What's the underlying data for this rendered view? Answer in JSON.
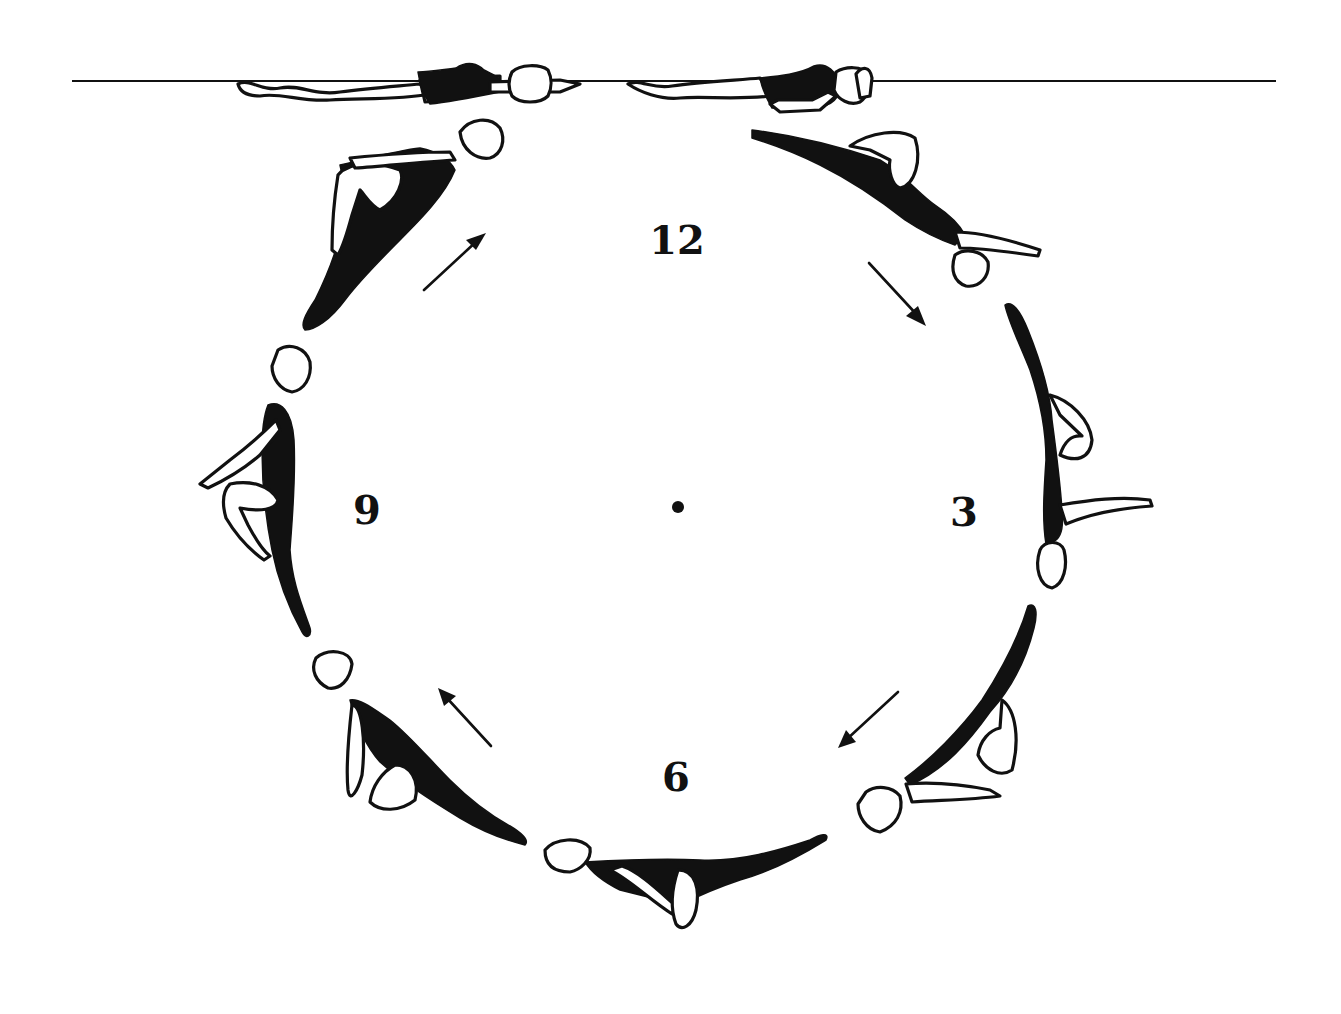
{
  "diagram": {
    "type": "synchronized-swimming-figure-rotation",
    "water_line": {
      "y": 81,
      "x_start": 72,
      "x_end": 1276
    },
    "center_marker": {
      "x": 678,
      "y": 507
    },
    "clock_labels": [
      {
        "id": "12",
        "text": "12",
        "x": 677,
        "y": 240
      },
      {
        "id": "3",
        "text": "3",
        "x": 964,
        "y": 512
      },
      {
        "id": "6",
        "text": "6",
        "x": 676,
        "y": 777
      },
      {
        "id": "9",
        "text": "9",
        "x": 367,
        "y": 510
      }
    ],
    "arrows": [
      {
        "id": "arrow-upper-left",
        "direction": "up-right",
        "from": [
          424,
          290
        ],
        "to": [
          484,
          234
        ]
      },
      {
        "id": "arrow-upper-right",
        "direction": "down-right",
        "from": [
          869,
          263
        ],
        "to": [
          925,
          324
        ]
      },
      {
        "id": "arrow-lower-right",
        "direction": "down-left",
        "from": [
          898,
          692
        ],
        "to": [
          838,
          747
        ]
      },
      {
        "id": "arrow-lower-left",
        "direction": "up-left",
        "from": [
          491,
          746
        ],
        "to": [
          440,
          690
        ]
      }
    ],
    "swimmers": [
      {
        "id": "surface-left",
        "position": "surface, back layout, facing right"
      },
      {
        "id": "surface-right",
        "position": "surface, back layout, head right"
      },
      {
        "id": "1-oclock",
        "position": "bent knee, descending"
      },
      {
        "id": "3-oclock",
        "position": "inverted vertical, bent knee"
      },
      {
        "id": "4-30",
        "position": "bent knee, head down-left"
      },
      {
        "id": "6-oclock",
        "position": "bottom, horizontal, bent knee"
      },
      {
        "id": "7-30",
        "position": "bent knee, ascending"
      },
      {
        "id": "9-oclock",
        "position": "vertical, head up, bent knee"
      },
      {
        "id": "10-30",
        "position": "bent knee, rising to surface"
      }
    ]
  }
}
